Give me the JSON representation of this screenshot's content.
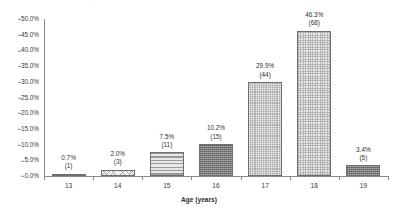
{
  "chart_data": {
    "type": "bar",
    "title": "",
    "xlabel": "Age (years)",
    "ylabel": "",
    "categories": [
      "13",
      "14",
      "15",
      "16",
      "17",
      "18",
      "19"
    ],
    "values": [
      0.7,
      2.0,
      7.5,
      10.2,
      29.9,
      46.3,
      3.4
    ],
    "counts": [
      1,
      3,
      11,
      15,
      44,
      68,
      5
    ],
    "percent_labels": [
      "0.7%",
      "2.0%",
      "7.5%",
      "10.2%",
      "29.9%",
      "46.3%",
      "3.4%"
    ],
    "count_labels": [
      "(1)",
      "(3)",
      "(11)",
      "(15)",
      "(44)",
      "(68)",
      "(5)"
    ],
    "ylim": [
      0,
      50
    ],
    "ytick_step": 5,
    "ytick_labels": [
      "0.0%",
      "5.0%",
      "10.0%",
      "15.0%",
      "20.0%",
      "25.0%",
      "30.0%",
      "35.0%",
      "40.0%",
      "45.0%",
      "50.0%"
    ],
    "ytick_values": [
      0,
      5,
      10,
      15,
      20,
      25,
      30,
      35,
      40,
      45,
      50
    ],
    "grid": false,
    "legend": "none",
    "bar_patterns": [
      "fill-light-stripe-h",
      "fill-diag-light",
      "fill-stripe-h",
      "fill-dot-dark",
      "fill-check-mid",
      "fill-check-light",
      "fill-dot-dark"
    ],
    "colors": {
      "axis": "#8a8a8a",
      "bar_outline": "#6f6f6f",
      "text": "#2f2f2f",
      "background": "#ffffff"
    }
  },
  "cutoff_caption": {
    "text": "o  o      a        p"
  }
}
